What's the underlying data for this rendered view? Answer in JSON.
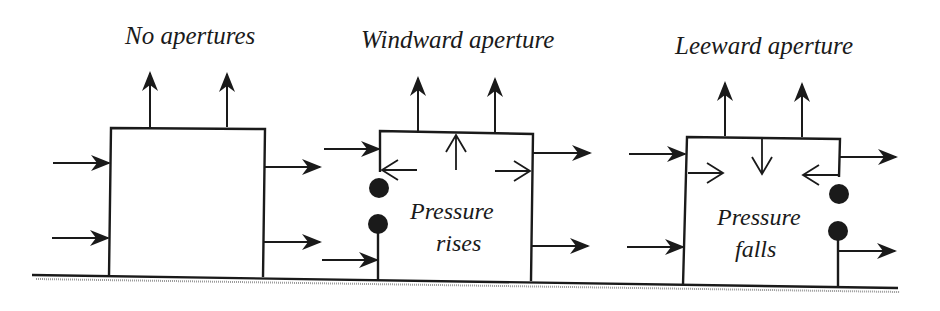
{
  "diagram": {
    "panels": [
      {
        "id": "no-apertures",
        "title": "No apertures",
        "inner_label": []
      },
      {
        "id": "windward-aperture",
        "title": "Windward aperture",
        "inner_label": [
          "Pressure",
          "rises"
        ]
      },
      {
        "id": "leeward-aperture",
        "title": "Leeward aperture",
        "inner_label": [
          "Pressure",
          "falls"
        ]
      }
    ],
    "colors": {
      "ink": "#1a1a1a",
      "ground_hatch": "#9a9a9a",
      "background": "#ffffff"
    }
  }
}
